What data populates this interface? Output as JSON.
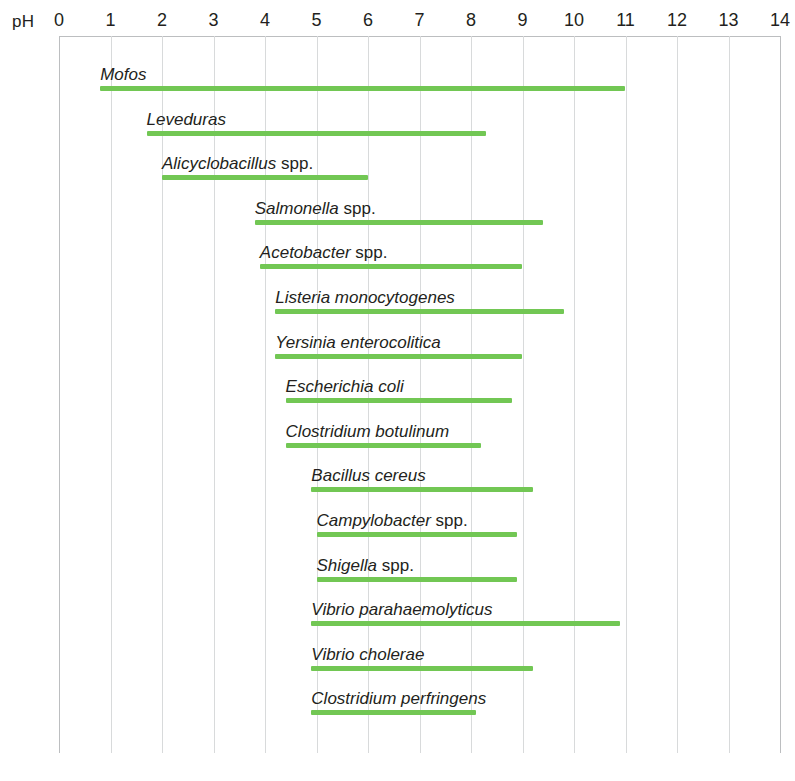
{
  "axis": {
    "title": "pH",
    "ticks": [
      0,
      1,
      2,
      3,
      4,
      5,
      6,
      7,
      8,
      9,
      10,
      11,
      12,
      13,
      14
    ],
    "tick_labels": [
      "0",
      "1",
      "2",
      "3",
      "4",
      "5",
      "6",
      "7",
      "8",
      "9",
      "10",
      "11",
      "12",
      "13",
      "14"
    ]
  },
  "colors": {
    "bar": "#72c754",
    "grid": "#d8dadb",
    "axis": "#bcbec0",
    "text": "#231f20"
  },
  "chart_data": {
    "type": "bar",
    "title": "pH",
    "xlabel": "pH",
    "ylabel": "",
    "xlim": [
      0,
      14
    ],
    "grid": true,
    "legend": "none",
    "orientation": "horizontal",
    "note": "Horizontal range (floating) bars: each bar spans the minimum-to-maximum pH for growth of the listed organism/group.",
    "categories": [
      "Mofos",
      "Leveduras",
      "Alicyclobacillus spp.",
      "Salmonella spp.",
      "Acetobacter spp.",
      "Listeria monocytogenes",
      "Yersinia enterocolitica",
      "Escherichia coli",
      "Clostridium botulinum",
      "Bacillus cereus",
      "Campylobacter spp.",
      "Shigella spp.",
      "Vibrio parahaemolyticus",
      "Vibrio cholerae",
      "Clostridium perfringens"
    ],
    "ranges": [
      [
        0.8,
        11.0
      ],
      [
        1.7,
        8.3
      ],
      [
        2.0,
        6.0
      ],
      [
        3.8,
        9.4
      ],
      [
        3.9,
        9.0
      ],
      [
        4.2,
        9.8
      ],
      [
        4.2,
        9.0
      ],
      [
        4.4,
        8.8
      ],
      [
        4.4,
        8.2
      ],
      [
        4.9,
        9.2
      ],
      [
        5.0,
        8.9
      ],
      [
        5.0,
        8.9
      ],
      [
        4.9,
        10.9
      ],
      [
        4.9,
        9.2
      ],
      [
        4.9,
        8.1
      ]
    ]
  },
  "rows": [
    {
      "label_italic": "Mofos",
      "label_plain": "",
      "min": 0.8,
      "max": 11.0
    },
    {
      "label_italic": "Leveduras",
      "label_plain": "",
      "min": 1.7,
      "max": 8.3
    },
    {
      "label_italic": "Alicyclobacillus",
      "label_plain": " spp.",
      "min": 2.0,
      "max": 6.0
    },
    {
      "label_italic": "Salmonella",
      "label_plain": " spp.",
      "min": 3.8,
      "max": 9.4
    },
    {
      "label_italic": "Acetobacter",
      "label_plain": " spp.",
      "min": 3.9,
      "max": 9.0
    },
    {
      "label_italic": "Listeria monocytogenes",
      "label_plain": "",
      "min": 4.2,
      "max": 9.8
    },
    {
      "label_italic": "Yersinia enterocolitica",
      "label_plain": "",
      "min": 4.2,
      "max": 9.0
    },
    {
      "label_italic": "Escherichia coli",
      "label_plain": "",
      "min": 4.4,
      "max": 8.8
    },
    {
      "label_italic": "Clostridium botulinum",
      "label_plain": "",
      "min": 4.4,
      "max": 8.2
    },
    {
      "label_italic": "Bacillus cereus",
      "label_plain": "",
      "min": 4.9,
      "max": 9.2
    },
    {
      "label_italic": "Campylobacter",
      "label_plain": " spp.",
      "min": 5.0,
      "max": 8.9
    },
    {
      "label_italic": "Shigella",
      "label_plain": " spp.",
      "min": 5.0,
      "max": 8.9
    },
    {
      "label_italic": "Vibrio parahaemolyticus",
      "label_plain": "",
      "min": 4.9,
      "max": 10.9
    },
    {
      "label_italic": "Vibrio cholerae",
      "label_plain": "",
      "min": 4.9,
      "max": 9.2
    },
    {
      "label_italic": "Clostridium perfringens",
      "label_plain": "",
      "min": 4.9,
      "max": 8.1
    }
  ],
  "geometry": {
    "x0": 59,
    "px_per_ph": 51.5,
    "first_row_bottom": 91,
    "row_step": 44.6
  }
}
